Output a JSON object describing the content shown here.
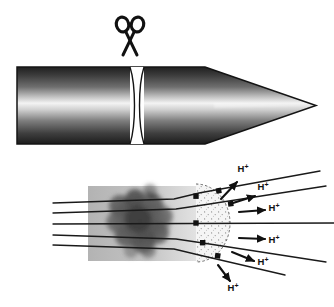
{
  "figure": {
    "background_color": "#ffffff",
    "width": 334,
    "height": 307
  },
  "panels": [
    {
      "id": "top-panel",
      "name": "bullet-cutaway-panel",
      "description": "Side view of a bullet-shaped projectile cut transversely by scissors"
    },
    {
      "id": "bottom-panel",
      "name": "proton-emission-panel",
      "description": "Magnified cut face showing field lines through a dark cluster emitting protons"
    }
  ],
  "bullet": {
    "name": "bullet-body",
    "body_left": 17,
    "body_right": 205,
    "top": 67,
    "bottom": 144,
    "tip_x": 316,
    "tip_y": 105.5,
    "cut_x": 137,
    "cut_half_width": 8,
    "outline_color": "#1a1a1a",
    "highlight_color": "#f2f2f2",
    "shadow_color": "#2a2a2a",
    "midtone_color": "#8a8a8a",
    "cut_face_color": "#ffffff"
  },
  "scissors": {
    "name": "scissors-icon",
    "label": "scissors",
    "center_x": 130,
    "center_y": 34,
    "color": "#111111"
  },
  "lower_diagram": {
    "slab": {
      "name": "target-slab",
      "left": 88,
      "top": 186,
      "right": 196,
      "bottom": 261,
      "fill_left": "#b6b6b6",
      "fill_right": "#d8d8d8"
    },
    "dome": {
      "name": "stippled-dome",
      "center_x": 196,
      "center_y": 223,
      "radius_x": 34,
      "radius_y": 39,
      "fill": "#f4f4f4",
      "stipple_color": "#7a7a7a",
      "edge_color": "#555555"
    },
    "cluster": {
      "name": "dark-cluster",
      "center_x": 140,
      "center_y": 221,
      "radius_x": 36,
      "radius_y": 32,
      "color": "#4a4a4a"
    },
    "field_lines": {
      "name": "field-line",
      "count": 5,
      "color": "#1a1a1a",
      "width": 1.3,
      "left_x": 53,
      "entry_y": [
        203,
        213,
        224,
        235,
        245
      ]
    },
    "markers": {
      "name": "exit-marker",
      "color": "#111111",
      "size": 5,
      "count": 6
    }
  },
  "protons": [
    {
      "id": 1,
      "label": "H",
      "charge": "+",
      "label_x": 243,
      "label_y": 172,
      "arrow_x1": 221,
      "arrow_y1": 199,
      "arrow_x2": 237,
      "arrow_y2": 182
    },
    {
      "id": 2,
      "label": "H",
      "charge": "+",
      "label_x": 263,
      "label_y": 190,
      "arrow_x1": 233,
      "arrow_y1": 203,
      "arrow_x2": 255,
      "arrow_y2": 196
    },
    {
      "id": 3,
      "label": "H",
      "charge": "+",
      "label_x": 274,
      "label_y": 211,
      "arrow_x1": 239,
      "arrow_y1": 212,
      "arrow_x2": 265,
      "arrow_y2": 210
    },
    {
      "id": 4,
      "label": "H",
      "charge": "+",
      "label_x": 274,
      "label_y": 243,
      "arrow_x1": 239,
      "arrow_y1": 238,
      "arrow_x2": 265,
      "arrow_y2": 239
    },
    {
      "id": 5,
      "label": "H",
      "charge": "+",
      "label_x": 263,
      "label_y": 265,
      "arrow_x1": 232,
      "arrow_y1": 252,
      "arrow_x2": 254,
      "arrow_y2": 261
    },
    {
      "id": 6,
      "label": "H",
      "charge": "+",
      "label_x": 233,
      "label_y": 291,
      "arrow_x1": 218,
      "arrow_y1": 265,
      "arrow_x2": 230,
      "arrow_y2": 281
    }
  ]
}
